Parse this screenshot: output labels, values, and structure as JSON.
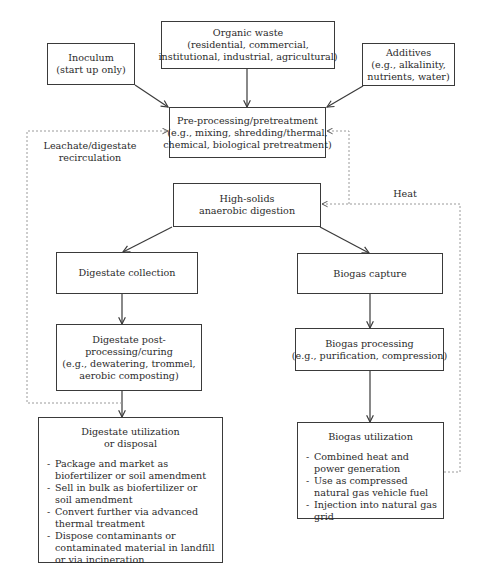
{
  "diagram": {
    "type": "flowchart",
    "nodes": {
      "inoculum": {
        "title": "Inoculum",
        "lines": [
          "(start up only)"
        ]
      },
      "organic_waste": {
        "title": "Organic waste",
        "lines": [
          "(residential, commercial,",
          "institutional, industrial, agricultural)"
        ]
      },
      "additives": {
        "title": "Additives",
        "lines": [
          "(e.g., alkalinity,",
          "nutrients, water)"
        ]
      },
      "preprocessing": {
        "title": "Pre-processing/pretreatment",
        "lines": [
          "(e.g., mixing, shredding/thermal,",
          "chemical, biological pretreatment)"
        ]
      },
      "digestion": {
        "title": "High-solids",
        "lines": [
          "anaerobic digestion"
        ]
      },
      "digestate_collection": {
        "title": "Digestate collection"
      },
      "biogas_capture": {
        "title": "Biogas capture"
      },
      "digestate_post": {
        "title": "Digestate post-",
        "lines": [
          "processing/curing",
          "(e.g., dewatering, trommel,",
          "aerobic composting)"
        ]
      },
      "biogas_processing": {
        "title": "Biogas processing",
        "lines": [
          "(e.g., purification, compression)"
        ]
      },
      "digestate_utilization": {
        "title": "Digestate utilization",
        "subtitle": "or disposal",
        "items": [
          "Package and market as biofertilizer or soil amendment",
          "Sell in bulk as biofertilizer or soil amendment",
          "Convert further via advanced thermal treatment",
          "Dispose contaminants or contaminated material in landfill or via incineration"
        ]
      },
      "biogas_utilization": {
        "title": "Biogas utilization",
        "items": [
          "Combined heat and power generation",
          "Use as compressed natural gas vehicle fuel",
          "Injection into natural gas grid"
        ]
      }
    },
    "edge_labels": {
      "recirculation_line1": "Leachate/digestate",
      "recirculation_line2": "recirculation",
      "heat": "Heat"
    },
    "edges": [
      {
        "from": "inoculum",
        "to": "preprocessing",
        "style": "solid"
      },
      {
        "from": "organic_waste",
        "to": "preprocessing",
        "style": "solid"
      },
      {
        "from": "additives",
        "to": "preprocessing",
        "style": "solid"
      },
      {
        "from": "digestion",
        "to": "digestate_collection",
        "style": "solid"
      },
      {
        "from": "digestion",
        "to": "biogas_capture",
        "style": "solid"
      },
      {
        "from": "digestate_collection",
        "to": "digestate_post",
        "style": "solid"
      },
      {
        "from": "digestate_post",
        "to": "digestate_utilization",
        "style": "solid"
      },
      {
        "from": "biogas_capture",
        "to": "biogas_processing",
        "style": "solid"
      },
      {
        "from": "biogas_processing",
        "to": "biogas_utilization",
        "style": "solid"
      },
      {
        "from": "digestate_post",
        "to": "preprocessing",
        "style": "dashed",
        "label": "Leachate/digestate recirculation"
      },
      {
        "from": "biogas_utilization",
        "to": "digestion",
        "style": "dashed",
        "label": "Heat"
      },
      {
        "from": "biogas_utilization",
        "to": "preprocessing",
        "style": "dashed",
        "label": "Heat"
      }
    ],
    "colors": {
      "line": "#3a3a3a",
      "dashed": "#9a9a9a",
      "text": "#2b2b2b"
    }
  }
}
